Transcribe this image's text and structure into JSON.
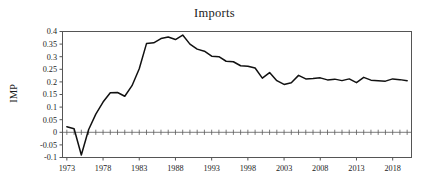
{
  "chart_data": {
    "type": "line",
    "title": "Imports",
    "xlabel": "",
    "ylabel": "IMP",
    "xlim": [
      1972.4,
      2020.6
    ],
    "ylim": [
      -0.1,
      0.4
    ],
    "grid": false,
    "legend": null,
    "zero_reference_line": true,
    "x_tick_labels": [
      "1973",
      "1978",
      "1983",
      "1988",
      "1993",
      "1998",
      "2003",
      "2008",
      "2013",
      "2018"
    ],
    "x_tick_values": [
      1973,
      1978,
      1983,
      1988,
      1993,
      1998,
      2003,
      2008,
      2013,
      2018
    ],
    "y_tick_labels": [
      "0.4",
      "0.35",
      "0.3",
      "0.25",
      "0.2",
      "0.15",
      "0.1",
      "0.05",
      "0",
      "-0.05",
      "-0.1"
    ],
    "y_tick_values": [
      0.4,
      0.35,
      0.3,
      0.25,
      0.2,
      0.15,
      0.1,
      0.05,
      0,
      -0.05,
      -0.1
    ],
    "series": [
      {
        "name": "IMP",
        "color": "#111111",
        "x": [
          1973,
          1974,
          1975,
          1976,
          1977,
          1978,
          1979,
          1980,
          1981,
          1982,
          1983,
          1984,
          1985,
          1986,
          1987,
          1988,
          1989,
          1990,
          1991,
          1992,
          1993,
          1994,
          1995,
          1996,
          1997,
          1998,
          1999,
          2000,
          2001,
          2002,
          2003,
          2004,
          2005,
          2006,
          2007,
          2008,
          2009,
          2010,
          2011,
          2012,
          2013,
          2014,
          2015,
          2016,
          2017,
          2018,
          2019,
          2020
        ],
        "values": [
          0.022,
          0.014,
          -0.09,
          0.01,
          0.072,
          0.12,
          0.157,
          0.158,
          0.143,
          0.185,
          0.252,
          0.352,
          0.355,
          0.372,
          0.378,
          0.368,
          0.386,
          0.35,
          0.33,
          0.322,
          0.302,
          0.3,
          0.282,
          0.28,
          0.264,
          0.262,
          0.255,
          0.215,
          0.237,
          0.205,
          0.19,
          0.197,
          0.226,
          0.212,
          0.213,
          0.216,
          0.208,
          0.211,
          0.205,
          0.212,
          0.197,
          0.218,
          0.207,
          0.205,
          0.203,
          0.212,
          0.209,
          0.205
        ]
      }
    ]
  },
  "figure": {
    "title": "Imports",
    "y_axis_label": "IMP",
    "background_color": "#ffffff",
    "line_color": "#111111",
    "axis_color": "#555555"
  }
}
